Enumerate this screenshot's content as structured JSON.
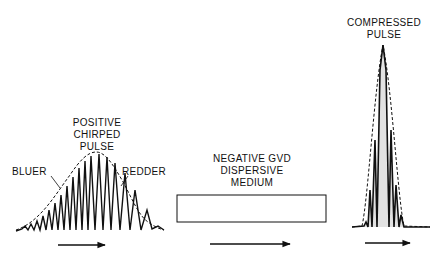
{
  "diagram": {
    "stages": [
      {
        "id": "input",
        "title_lines": [
          "POSITIVE",
          "CHIRPED",
          "PULSE"
        ],
        "annotations": {
          "left": "BLUER",
          "right": "REDDER"
        }
      },
      {
        "id": "medium",
        "title_lines": [
          "NEGATIVE GVD",
          "DISPERSIVE",
          "MEDIUM"
        ]
      },
      {
        "id": "output",
        "title_lines": [
          "COMPRESSED",
          "PULSE"
        ]
      }
    ],
    "colors": {
      "ink": "#111111",
      "background": "#ffffff"
    }
  }
}
